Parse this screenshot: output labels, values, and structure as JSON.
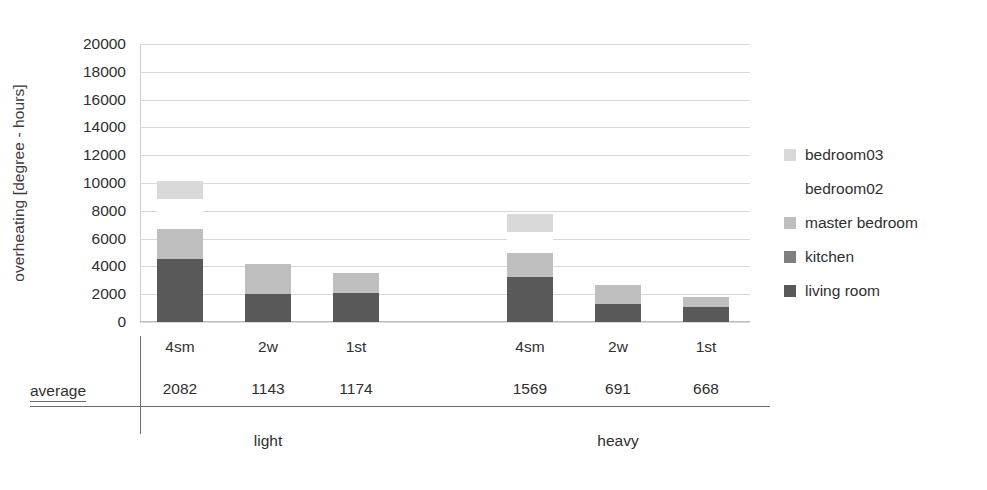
{
  "chart_data": {
    "type": "bar",
    "subtype": "stacked",
    "title": "",
    "xlabel": "",
    "ylabel": "overheating [degree - hours]",
    "ylim": [
      0,
      20000
    ],
    "ytick_step": 2000,
    "yticks": [
      "20000",
      "18000",
      "16000",
      "14000",
      "12000",
      "10000",
      "8000",
      "6000",
      "4000",
      "2000",
      "0"
    ],
    "grid": true,
    "legend_position": "right",
    "categories": [
      "4sm",
      "2w",
      "1st",
      "4sm",
      "2w",
      "1st"
    ],
    "groups": [
      {
        "label": "light",
        "categories": [
          "4sm",
          "2w",
          "1st"
        ]
      },
      {
        "label": "heavy",
        "categories": [
          "4sm",
          "2w",
          "1st"
        ]
      }
    ],
    "series": [
      {
        "name": "living room",
        "color": "#595959",
        "values": [
          4530,
          2050,
          2080,
          3235,
          1295,
          1080
        ]
      },
      {
        "name": "kitchen",
        "color": "#7f7f7f",
        "values": [
          0,
          0,
          0,
          0,
          0,
          0
        ]
      },
      {
        "name": "master bedroom",
        "color": "#bfbfbf",
        "values": [
          2160,
          2150,
          1420,
          1725,
          1365,
          720
        ]
      },
      {
        "name": "bedroom02",
        "color": "#ffffff",
        "values": [
          2160,
          0,
          0,
          1510,
          0,
          0
        ]
      },
      {
        "name": "bedroom03",
        "color": "#d9d9d9",
        "values": [
          1290,
          0,
          0,
          1300,
          0,
          0
        ]
      }
    ],
    "bar_totals": [
      10140,
      4200,
      3500,
      7770,
      2660,
      1800
    ],
    "table": {
      "row_label": "average",
      "values": [
        "2082",
        "1143",
        "1174",
        "1569",
        "691",
        "668"
      ]
    }
  },
  "legend": {
    "items": [
      {
        "label": "bedroom03",
        "color": "#d9d9d9",
        "has_swatch": true
      },
      {
        "label": "bedroom02",
        "color": "#ffffff",
        "has_swatch": false
      },
      {
        "label": "master bedroom",
        "color": "#bfbfbf",
        "has_swatch": true
      },
      {
        "label": "kitchen",
        "color": "#7f7f7f",
        "has_swatch": true
      },
      {
        "label": "living room",
        "color": "#595959",
        "has_swatch": true
      }
    ]
  }
}
